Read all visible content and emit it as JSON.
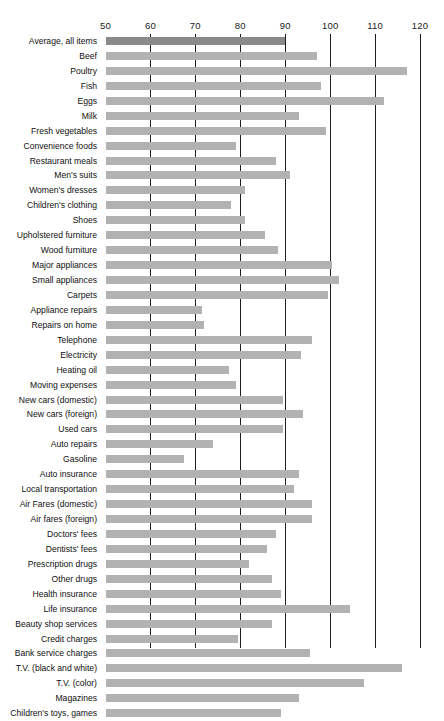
{
  "chart_data": {
    "type": "bar",
    "orientation": "horizontal",
    "title": "",
    "subtitle": "",
    "xlabel": "",
    "ylabel": "",
    "xlim": [
      50,
      120
    ],
    "ticks": [
      50,
      60,
      70,
      80,
      90,
      100,
      110,
      120
    ],
    "tick_labels": [
      "50",
      "60",
      "70",
      "80",
      "90",
      "100",
      "110",
      "120"
    ],
    "grid": true,
    "grid_axis": "x",
    "legend": "none",
    "baseline_value": 50,
    "highlight_category": "Average, all items",
    "colors": {
      "bar": "#b2b2b2",
      "highlight_bar": "#8a8a8a",
      "gridline": "#1c1c1c",
      "text": "#101010",
      "background": "#ffffff"
    },
    "categories": [
      "Average, all items",
      "Beef",
      "Poultry",
      "Fish",
      "Eggs",
      "Milk",
      "Fresh vegetables",
      "Convenience foods",
      "Restaurant meals",
      "Men's suits",
      "Women's dresses",
      "Children's clothing",
      "Shoes",
      "Upholstered furniture",
      "Wood furniture",
      "Major appliances",
      "Small appliances",
      "Carpets",
      "Appliance repairs",
      "Repairs on home",
      "Telephone",
      "Electricity",
      "Heating oil",
      "Moving expenses",
      "New cars (domestic)",
      "New cars (foreign)",
      "Used cars",
      "Auto repairs",
      "Gasoline",
      "Auto insurance",
      "Local transportation",
      "Air Fares (domestic)",
      "Air fares (foreign)",
      "Doctors' fees",
      "Dentists' fees",
      "Prescription drugs",
      "Other drugs",
      "Health insurance",
      "Life insurance",
      "Beauty shop services",
      "Credit charges",
      "Bank service charges",
      "T.V. (black and white)",
      "T.V. (color)",
      "Magazines",
      "Children's toys, games"
    ],
    "values": [
      90.0,
      97.0,
      117.0,
      98.0,
      112.0,
      93.0,
      99.0,
      79.0,
      88.0,
      91.0,
      81.0,
      78.0,
      81.0,
      85.5,
      88.5,
      100.5,
      102.0,
      99.5,
      71.5,
      72.0,
      96.0,
      93.5,
      77.5,
      79.0,
      89.5,
      94.0,
      89.5,
      74.0,
      67.5,
      93.0,
      92.0,
      96.0,
      96.0,
      88.0,
      86.0,
      82.0,
      87.0,
      89.0,
      104.5,
      87.0,
      79.5,
      95.5,
      116.0,
      107.5,
      93.0,
      89.0
    ]
  }
}
